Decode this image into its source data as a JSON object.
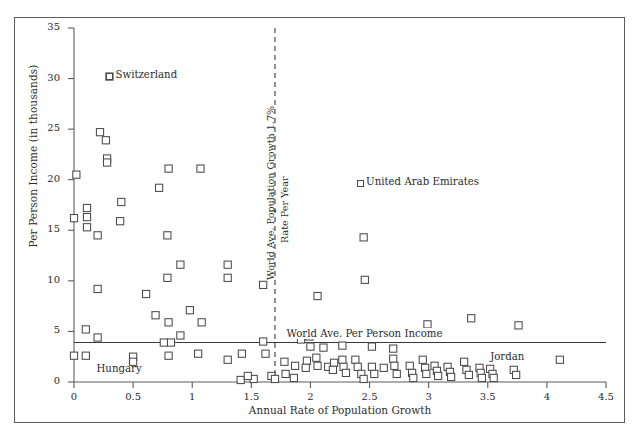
{
  "chart_data": {
    "type": "scatter",
    "title": "",
    "xlabel": "Annual Rate of Population Growth",
    "ylabel": "Per Person Income (in thousands)",
    "xlim": [
      0,
      4.5
    ],
    "ylim": [
      0,
      35
    ],
    "xticks": [
      "0",
      "0.5",
      "1",
      "1.5",
      "2",
      "2.5",
      "3",
      "3.5",
      "4",
      "4.5"
    ],
    "xtick_values": [
      0,
      0.5,
      1,
      1.5,
      2,
      2.5,
      3,
      3.5,
      4,
      4.5
    ],
    "yticks": [
      "0",
      "5",
      "10",
      "15",
      "20",
      "25",
      "30",
      "35"
    ],
    "ytick_values": [
      0,
      5,
      10,
      15,
      20,
      25,
      30,
      35
    ],
    "grid": false,
    "marker": "open-square",
    "marker_color": "#4a4a4a",
    "legend_position": "none",
    "reference_lines": [
      {
        "name": "world-avg-population-growth",
        "orientation": "vertical",
        "value": 1.7,
        "style": "dashed",
        "label": "World Ave. Population Growth 1.7% Rate Per Year"
      },
      {
        "name": "world-avg-per-person-income",
        "orientation": "horizontal",
        "value": 3.9,
        "style": "solid",
        "label": "World Ave. Per Person Income"
      }
    ],
    "annotations": [
      {
        "name": "switzerland",
        "text": "Switzerland",
        "x": 0.3,
        "y": 30.2
      },
      {
        "name": "united-arab-emirates",
        "text": "United Arab Emirates",
        "x": 2.42,
        "y": 19.6
      },
      {
        "name": "hungary",
        "text": "Hungary",
        "x": 0.19,
        "y": 1.2
      },
      {
        "name": "jordan",
        "text": "Jordan",
        "x": 3.52,
        "y": 2.4
      }
    ],
    "points": [
      [
        0.3,
        30.2
      ],
      [
        0.02,
        20.5
      ],
      [
        0.22,
        24.7
      ],
      [
        0.27,
        23.9
      ],
      [
        0.28,
        22.1
      ],
      [
        0.28,
        21.7
      ],
      [
        0.8,
        21.1
      ],
      [
        1.07,
        21.1
      ],
      [
        0.72,
        19.2
      ],
      [
        0.4,
        17.8
      ],
      [
        0.11,
        17.2
      ],
      [
        0.11,
        16.3
      ],
      [
        0.0,
        16.2
      ],
      [
        0.11,
        15.3
      ],
      [
        0.39,
        15.9
      ],
      [
        0.2,
        14.5
      ],
      [
        0.79,
        14.5
      ],
      [
        2.45,
        14.3
      ],
      [
        1.3,
        11.6
      ],
      [
        0.9,
        11.6
      ],
      [
        0.79,
        10.3
      ],
      [
        1.3,
        10.3
      ],
      [
        2.46,
        10.1
      ],
      [
        1.6,
        9.6
      ],
      [
        0.2,
        9.2
      ],
      [
        0.61,
        8.7
      ],
      [
        2.06,
        8.5
      ],
      [
        0.98,
        7.1
      ],
      [
        0.69,
        6.6
      ],
      [
        0.8,
        5.9
      ],
      [
        1.08,
        5.9
      ],
      [
        2.99,
        5.7
      ],
      [
        3.36,
        6.3
      ],
      [
        3.76,
        5.6
      ],
      [
        0.1,
        5.2
      ],
      [
        0.9,
        4.6
      ],
      [
        0.2,
        4.4
      ],
      [
        0.82,
        3.9
      ],
      [
        0.76,
        3.9
      ],
      [
        1.6,
        4.0
      ],
      [
        1.92,
        4.2
      ],
      [
        1.99,
        4.5
      ],
      [
        2.0,
        3.5
      ],
      [
        2.11,
        3.4
      ],
      [
        2.27,
        3.6
      ],
      [
        2.52,
        3.5
      ],
      [
        2.7,
        3.3
      ],
      [
        0.0,
        2.6
      ],
      [
        0.1,
        2.6
      ],
      [
        0.5,
        2.5
      ],
      [
        0.5,
        2.0
      ],
      [
        0.8,
        2.6
      ],
      [
        1.05,
        2.8
      ],
      [
        1.3,
        2.2
      ],
      [
        1.42,
        2.8
      ],
      [
        1.62,
        2.8
      ],
      [
        1.78,
        2.0
      ],
      [
        1.87,
        1.6
      ],
      [
        1.97,
        2.1
      ],
      [
        1.96,
        1.4
      ],
      [
        2.05,
        2.4
      ],
      [
        2.06,
        1.6
      ],
      [
        2.15,
        1.5
      ],
      [
        2.27,
        2.2
      ],
      [
        2.28,
        1.5
      ],
      [
        2.3,
        0.9
      ],
      [
        2.38,
        2.2
      ],
      [
        2.4,
        1.5
      ],
      [
        2.43,
        0.8
      ],
      [
        2.45,
        0.3
      ],
      [
        2.52,
        1.5
      ],
      [
        2.54,
        0.8
      ],
      [
        2.62,
        1.4
      ],
      [
        2.7,
        2.3
      ],
      [
        2.71,
        1.6
      ],
      [
        2.73,
        0.8
      ],
      [
        2.84,
        1.6
      ],
      [
        2.86,
        0.9
      ],
      [
        2.87,
        0.4
      ],
      [
        2.95,
        2.2
      ],
      [
        2.97,
        1.4
      ],
      [
        2.98,
        0.8
      ],
      [
        3.05,
        1.6
      ],
      [
        3.07,
        1.1
      ],
      [
        3.08,
        0.6
      ],
      [
        3.16,
        1.5
      ],
      [
        3.18,
        1.0
      ],
      [
        3.19,
        0.5
      ],
      [
        3.3,
        2.0
      ],
      [
        3.32,
        1.2
      ],
      [
        3.34,
        0.7
      ],
      [
        3.43,
        1.4
      ],
      [
        3.44,
        0.9
      ],
      [
        3.45,
        0.4
      ],
      [
        3.52,
        1.3
      ],
      [
        3.54,
        0.8
      ],
      [
        3.55,
        0.4
      ],
      [
        3.72,
        1.2
      ],
      [
        3.74,
        0.7
      ],
      [
        4.11,
        2.2
      ],
      [
        1.52,
        0.3
      ],
      [
        1.41,
        0.2
      ],
      [
        1.67,
        0.6
      ],
      [
        1.7,
        0.3
      ],
      [
        1.79,
        0.8
      ],
      [
        1.86,
        0.4
      ],
      [
        1.47,
        0.6
      ],
      [
        2.2,
        1.9
      ],
      [
        2.19,
        1.2
      ]
    ]
  }
}
